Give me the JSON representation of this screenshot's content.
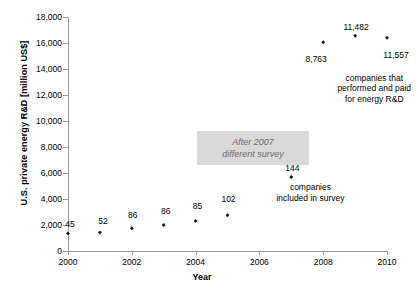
{
  "chart_data": {
    "type": "scatter",
    "title": "",
    "xlabel": "Year",
    "ylabel": "U.S. private energy R&D [million US$]",
    "xlim": [
      2000,
      2010
    ],
    "ylim": [
      0,
      18000
    ],
    "ytick_labels": [
      "18,000",
      "16,000",
      "14,000",
      "12,000",
      "10,000",
      "8,000",
      "6,000",
      "4,000",
      "2,000",
      "0"
    ],
    "ytick_values": [
      18000,
      16000,
      14000,
      12000,
      10000,
      8000,
      6000,
      4000,
      2000,
      0
    ],
    "xtick_labels": [
      "2000",
      "2002",
      "2004",
      "2006",
      "2008",
      "2010"
    ],
    "xtick_values": [
      2000,
      2002,
      2004,
      2006,
      2008,
      2010
    ],
    "grid": false,
    "legend": "none",
    "series": [
      {
        "name": "U.S. private energy R&D",
        "x": [
          2000,
          2001,
          2002,
          2003,
          2004,
          2005,
          2006,
          2007,
          2008,
          2009,
          2010
        ],
        "values": [
          1350,
          1420,
          1750,
          2000,
          2300,
          2750,
          null,
          5700,
          16050,
          16550,
          16400
        ],
        "point_labels": [
          "45",
          "52",
          "86",
          "86",
          "85",
          "102",
          "107",
          "144",
          "8,763",
          "11,482",
          "11,557"
        ]
      }
    ],
    "annotations": [
      {
        "text": "companies\nincluded in survey",
        "x": 2007.6,
        "y": 5300
      },
      {
        "text": "companies that\nperformed and paid\nfor energy R&D",
        "x": 2009.6,
        "y": 13700
      },
      {
        "text": "After 2007\ndifferent survey",
        "x": 2005.8,
        "y": 9200
      }
    ]
  },
  "labels": {
    "y_axis_title": "U.S. private energy R&D [million US$]",
    "x_axis_title": "Year",
    "y_ticks": [
      "18,000",
      "16,000",
      "14,000",
      "12,000",
      "10,000",
      "8,000",
      "6,000",
      "4,000",
      "2,000",
      "0"
    ],
    "x_ticks": [
      "2000",
      "2002",
      "2004",
      "2006",
      "2008",
      "2010"
    ],
    "point_labels": [
      "45",
      "52",
      "86",
      "86",
      "85",
      "102",
      "107",
      "144",
      "8,763",
      "11,482",
      "11,557"
    ],
    "note_included": "companies\nincluded in survey",
    "note_performed": "companies that\nperformed and paid\nfor energy R&D",
    "note_survey": "After 2007\ndifferent survey"
  },
  "colors": {
    "marker": "#1a1a1a",
    "axis": "#9a9a9a",
    "note_box_bg": "#d9d9d9",
    "note_box_text": "#6b6b6b",
    "text": "#000000"
  }
}
